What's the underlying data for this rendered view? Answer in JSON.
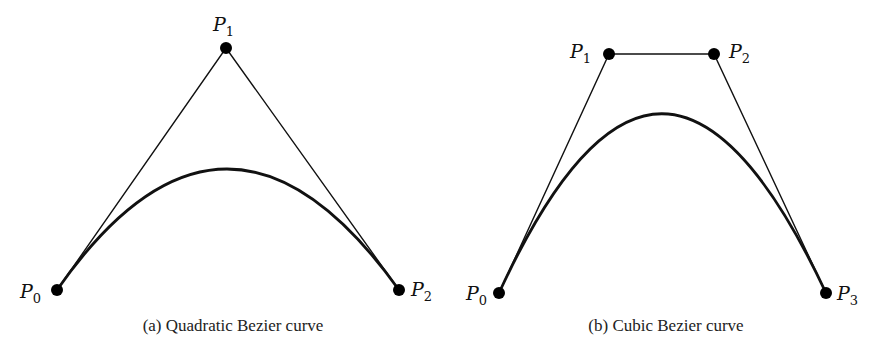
{
  "figures": [
    {
      "id": "a",
      "caption": "(a) Quadratic Bezier curve",
      "type": "quadratic",
      "control_points": [
        {
          "name": "P",
          "sub": "0",
          "x": 57,
          "y": 290
        },
        {
          "name": "P",
          "sub": "1",
          "x": 226,
          "y": 48
        },
        {
          "name": "P",
          "sub": "2",
          "x": 399,
          "y": 290
        }
      ]
    },
    {
      "id": "b",
      "caption": "(b) Cubic Bezier curve",
      "type": "cubic",
      "control_points": [
        {
          "name": "P",
          "sub": "0",
          "x": 499,
          "y": 293
        },
        {
          "name": "P",
          "sub": "1",
          "x": 609,
          "y": 54
        },
        {
          "name": "P",
          "sub": "2",
          "x": 714,
          "y": 54
        },
        {
          "name": "P",
          "sub": "3",
          "x": 826,
          "y": 293
        }
      ]
    }
  ],
  "colors": {
    "line": "#111111",
    "point": "#000000",
    "background": "#ffffff"
  }
}
